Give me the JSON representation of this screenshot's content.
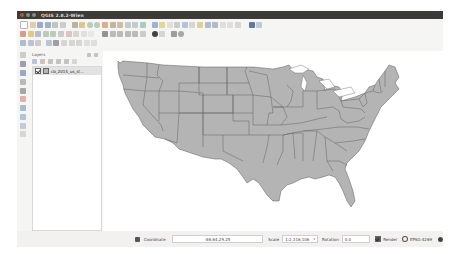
{
  "window": {
    "title": "QGIS 2.8.2-Wien",
    "buttons": [
      "close",
      "minimize",
      "maximize"
    ]
  },
  "toolbars": {
    "row1_icons": [
      "new-project-icon",
      "open-project-icon",
      "save-project-icon",
      "save-as-icon",
      "print-composer-icon",
      "composer-manager-icon",
      "pan-icon",
      "pan-to-selection-icon",
      "zoom-in-icon",
      "zoom-out-icon",
      "zoom-full-icon",
      "zoom-to-layer-icon",
      "zoom-to-selection-icon",
      "zoom-last-icon",
      "zoom-next-icon",
      "refresh-icon",
      "identify-icon",
      "select-icon",
      "deselect-icon",
      "field-calculator-icon",
      "attribute-table-icon",
      "measure-icon",
      "map-tips-icon",
      "new-bookmark-icon",
      "show-bookmarks-icon",
      "text-annotation-icon",
      "help-icon",
      "plugin-icon",
      "python-console-icon"
    ],
    "row2_icons": [
      "current-edits-icon",
      "toggle-editing-icon",
      "save-edits-icon",
      "add-feature-icon",
      "move-feature-icon",
      "node-tool-icon",
      "delete-selected-icon",
      "cut-features-icon",
      "copy-features-icon",
      "paste-features-icon",
      "label-icon",
      "pin-labels-icon",
      "show-labels-icon",
      "move-label-icon",
      "rotate-label-icon",
      "change-label-icon",
      "styling-icon",
      "layer-diagram-icon",
      "grass-icon",
      "settings-icon"
    ],
    "row3_icons": [
      "digitize-icon",
      "simplify-icon",
      "add-ring-icon",
      "add-part-icon",
      "fill-ring-icon",
      "delete-ring-icon",
      "delete-part-icon",
      "reshape-icon",
      "offset-curve-icon",
      "split-features-icon"
    ],
    "left_icons": [
      "add-vector-layer-icon",
      "add-raster-layer-icon",
      "add-postgis-layer-icon",
      "add-spatialite-layer-icon",
      "add-mssql-layer-icon",
      "add-oracle-layer-icon",
      "add-wms-layer-icon",
      "add-wcs-layer-icon",
      "add-wfs-layer-icon",
      "new-shapefile-icon"
    ]
  },
  "layers_panel": {
    "title": "Layers",
    "tool_icons": [
      "add-group-icon",
      "manage-visibility-icon",
      "filter-legend-icon",
      "expand-all-icon",
      "collapse-all-icon",
      "remove-layer-icon"
    ],
    "layers": [
      {
        "name": "cb_2014_us_st...",
        "checked": true,
        "fill_color": "#b4b4b4"
      }
    ]
  },
  "map": {
    "fill_color": "#b4b4b4",
    "stroke_color": "#5a5a5a",
    "background": "#ffffff"
  },
  "statusbar": {
    "coordinate_label": "Coordinate",
    "coordinate_value": "-86.64,29.25",
    "scale_label": "Scale",
    "scale_value": "1:2,316,106",
    "rotation_label": "Rotation",
    "rotation_value": "0.0",
    "render_label": "Render",
    "render_checked": true,
    "crs_label": "EPSG:4269"
  }
}
